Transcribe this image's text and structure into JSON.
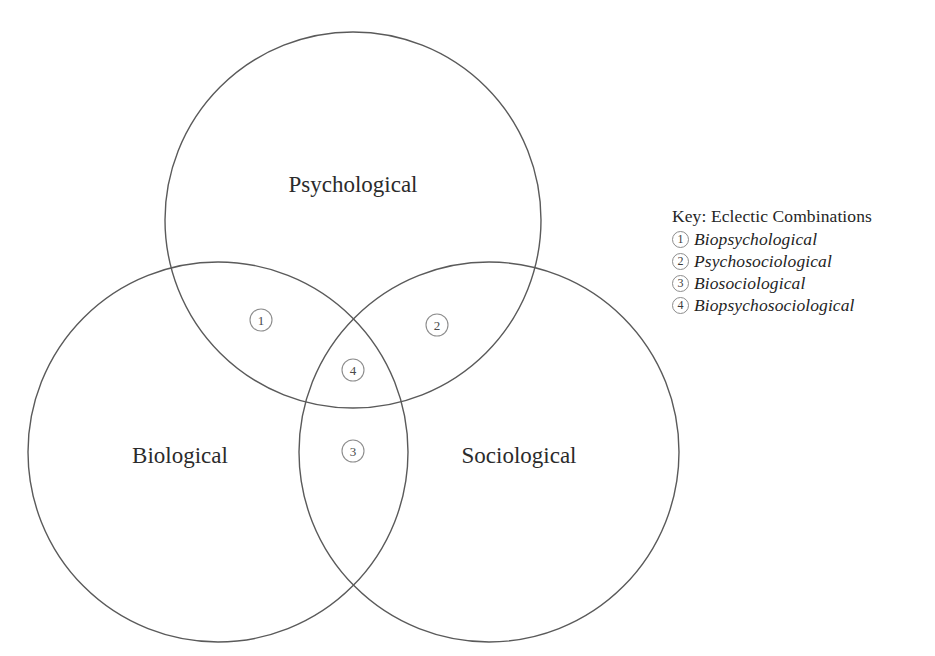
{
  "diagram": {
    "type": "venn-3-set",
    "background_color": "#ffffff",
    "stroke_color": "#5a5a5a",
    "marker_stroke_color": "#8d8d8d",
    "text_color": "#2b2b2b",
    "sets": [
      {
        "id": "psychological",
        "label": "Psychological",
        "cx": 353,
        "cy": 220,
        "r": 188,
        "label_x": 353,
        "label_y": 192
      },
      {
        "id": "biological",
        "label": "Biological",
        "cx": 218,
        "cy": 452,
        "r": 190,
        "label_x": 180,
        "label_y": 463
      },
      {
        "id": "sociological",
        "label": "Sociological",
        "cx": 489,
        "cy": 452,
        "r": 190,
        "label_x": 519,
        "label_y": 463
      }
    ],
    "intersection_markers": [
      {
        "number": "1",
        "x": 261,
        "y": 320,
        "region": "psychological-biological"
      },
      {
        "number": "2",
        "x": 437,
        "y": 325,
        "region": "psychological-sociological"
      },
      {
        "number": "4",
        "x": 353,
        "y": 370,
        "region": "psychological-biological-sociological"
      },
      {
        "number": "3",
        "x": 353,
        "y": 451,
        "region": "biological-sociological"
      }
    ]
  },
  "key": {
    "title": "Key: Eclectic Combinations",
    "items": [
      {
        "number": "1",
        "label": "Biopsychological"
      },
      {
        "number": "2",
        "label": "Psychosociological"
      },
      {
        "number": "3",
        "label": "Biosociological"
      },
      {
        "number": "4",
        "label": "Biopsychosociological"
      }
    ]
  }
}
